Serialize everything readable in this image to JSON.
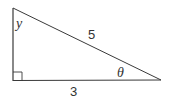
{
  "diagram": {
    "type": "right-triangle",
    "stroke_color": "#3a3a3a",
    "vertices": {
      "top": [
        13,
        8
      ],
      "right_angle": [
        13,
        80.5
      ],
      "right": [
        161,
        80
      ]
    },
    "labels": {
      "angle_top": "y",
      "hypotenuse": "5",
      "angle_right": "θ",
      "base": "3"
    },
    "right_angle_marker": true
  }
}
